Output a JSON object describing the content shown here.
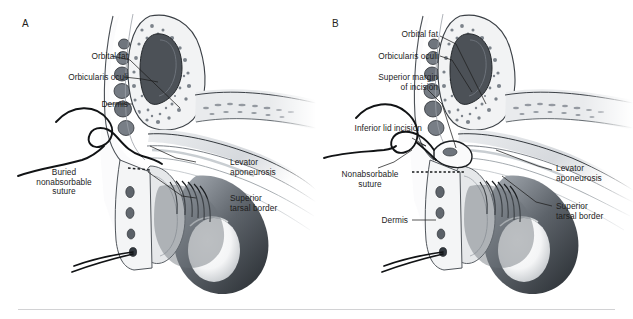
{
  "figure": {
    "background_color": "#ffffff",
    "text_color": "#1d1d1d",
    "divider_color": "#d2d2d4",
    "width": 633,
    "height": 319
  },
  "panels": [
    {
      "letter": "A",
      "name": "panel-a",
      "caption": "Buried nonabsorbable suture passed from dermis to levator aponeurosis",
      "labels": [
        {
          "id": "orbital-fat",
          "text": "Orbital fat",
          "align": "right"
        },
        {
          "id": "orbicularis-oculi",
          "text": "Orbicularis oculi",
          "align": "right"
        },
        {
          "id": "dermis",
          "text": "Dermis",
          "align": "right"
        },
        {
          "id": "buried-suture",
          "text": "Buried\nnonabsorbable\nsuture",
          "align": "center"
        },
        {
          "id": "levator-aponeurosis",
          "text": "Levator\naponeurosis",
          "align": "left"
        },
        {
          "id": "superior-tarsal-border",
          "text": "Superior\ntarsal border",
          "align": "left"
        }
      ]
    },
    {
      "letter": "B",
      "name": "panel-b",
      "caption": "Suture engaging superior margin of incision and inferior lid incision",
      "labels": [
        {
          "id": "orbital-fat",
          "text": "Orbital fat",
          "align": "right"
        },
        {
          "id": "orbicularis-oculi",
          "text": "Orbicularis oculi",
          "align": "right"
        },
        {
          "id": "superior-margin",
          "text": "Superior margin\nof incision",
          "align": "right"
        },
        {
          "id": "inferior-lid-incision",
          "text": "Inferior lid incision",
          "align": "right"
        },
        {
          "id": "nonabsorbable-suture",
          "text": "Nonabsorbable\nsuture",
          "align": "center"
        },
        {
          "id": "dermis",
          "text": "Dermis",
          "align": "right"
        },
        {
          "id": "levator-aponeurosis",
          "text": "Levator\naponeurosis",
          "align": "left"
        },
        {
          "id": "superior-tarsal-border",
          "text": "Superior\ntarsal border",
          "align": "left"
        }
      ]
    }
  ],
  "anatomy_colors": {
    "orbital_fat_mass": "#4c5157",
    "fat_speckle": "#7d848c",
    "tissue_light": "#ececee",
    "tissue_mid": "#c9ccd0",
    "tissue_dark": "#8a9098",
    "tarsal_plate": "#e4e6e8",
    "globe_shadow": "#5b6067",
    "suture_thread": "#131313",
    "outline": "#2a2a2a"
  }
}
